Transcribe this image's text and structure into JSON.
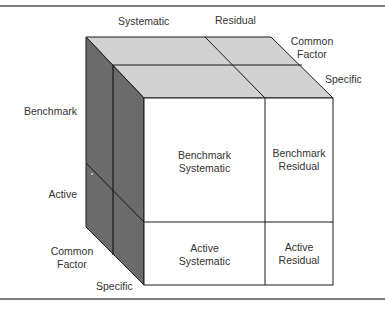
{
  "figure": {
    "axis_labels": {
      "columns": {
        "systematic": "Systematic",
        "residual": "Residual"
      },
      "depth_top": {
        "common_factor_line1": "Common",
        "common_factor_line2": "Factor",
        "specific": "Specific"
      },
      "rows": {
        "benchmark": "Benchmark",
        "active": "Active"
      },
      "depth_left": {
        "common_factor_line1": "Common",
        "common_factor_line2": "Factor",
        "specific": "Specific"
      }
    },
    "cells": {
      "benchmark_systematic": {
        "line1": "Benchmark",
        "line2": "Systematic"
      },
      "benchmark_residual": {
        "line1": "Benchmark",
        "line2": "Residual"
      },
      "active_systematic": {
        "line1": "Active",
        "line2": "Systematic"
      },
      "active_residual": {
        "line1": "Active",
        "line2": "Residual"
      }
    },
    "colors": {
      "top_face": "#d2d2d2",
      "side_face": "#6b6b6b",
      "front_face": "#ffffff",
      "edge": "#1a1a1a",
      "rule": "#555555"
    }
  }
}
